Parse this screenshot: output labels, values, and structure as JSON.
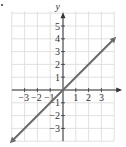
{
  "chart_data": {
    "type": "line",
    "title": "",
    "xlabel": "x",
    "ylabel": "y",
    "xlim": [
      -4,
      4
    ],
    "ylim": [
      -4,
      6
    ],
    "grid": true,
    "x_ticks": [
      "-3",
      "-2",
      "-1",
      "1",
      "2",
      "3"
    ],
    "y_ticks": [
      "5",
      "4",
      "3",
      "2",
      "1",
      "-1",
      "-2",
      "-3"
    ],
    "series": [
      {
        "name": "y = x",
        "x": [
          -4,
          4
        ],
        "y": [
          -4,
          4
        ],
        "arrows": "both"
      }
    ]
  },
  "colors": {
    "line": "#6b6b6b",
    "grid": "#d9d9d9",
    "axis": "#333333"
  }
}
